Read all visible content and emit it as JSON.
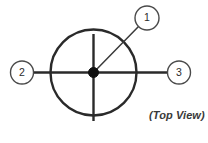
{
  "figure": {
    "name": "top-view-fan-diagram",
    "caption": "(Top View)",
    "background_color": "#ffffff",
    "line_color": "#2a2a2a",
    "hub_color": "#111111",
    "badge_stroke_color": "#4a4a4a",
    "caption_color": "#3a3a3a"
  },
  "part_circle": {
    "center_x": 93.5,
    "center_y": 72.5,
    "radius": 43
  },
  "hub": {
    "label": "center-hub",
    "center_x": 93.5,
    "center_y": 72.5,
    "radius": 5
  },
  "spokes": [
    {
      "name": "vertical-upper-spoke",
      "x1": 93.5,
      "y1": 34,
      "x2": 93.5,
      "y2": 72.5
    },
    {
      "name": "vertical-lower-spoke",
      "x1": 93.5,
      "y1": 72.5,
      "x2": 93.5,
      "y2": 121
    }
  ],
  "axle": {
    "name": "horizontal-axle",
    "x1": 34,
    "y1": 72.5,
    "x2": 168,
    "y2": 72.5
  },
  "callouts": [
    {
      "id": "callout-1",
      "label": "1",
      "badge_cx": 147,
      "badge_cy": 18,
      "badge_r": 12,
      "leader_x1": 138.5,
      "leader_y1": 26.5,
      "leader_x2": 95.5,
      "leader_y2": 70.5
    },
    {
      "id": "callout-2",
      "label": "2",
      "badge_cx": 22,
      "badge_cy": 72.5,
      "badge_r": 11.5,
      "leader_x1": 33.5,
      "leader_y1": 72.5,
      "leader_x2": 50.5,
      "leader_y2": 72.5
    },
    {
      "id": "callout-3",
      "label": "3",
      "badge_cx": 179,
      "badge_cy": 72.5,
      "badge_r": 11.5,
      "leader_x1": 167.5,
      "leader_y1": 72.5,
      "leader_x2": 136.5,
      "leader_y2": 72.5
    }
  ]
}
